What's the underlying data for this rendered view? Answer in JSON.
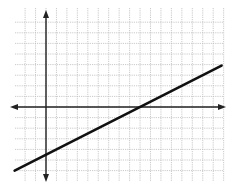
{
  "chart_data": {
    "type": "line",
    "title": "",
    "xlabel": "",
    "ylabel": "",
    "grid": true,
    "legend": null,
    "xlim": [
      -3,
      17
    ],
    "ylim": [
      -7,
      9
    ],
    "axis_arrows": true,
    "tick_labels": false,
    "series": [
      {
        "name": "line",
        "equation": "y = 0.5x - 4.5",
        "slope": 0.5,
        "y_intercept": -4.5,
        "x_intercept": 9,
        "x": [
          -3,
          16.8
        ],
        "y": [
          -6,
          3.9
        ]
      }
    ]
  },
  "colors": {
    "background": "#ffffff",
    "grid": "#bdbdbd",
    "axis": "#222222",
    "line": "#111111"
  }
}
